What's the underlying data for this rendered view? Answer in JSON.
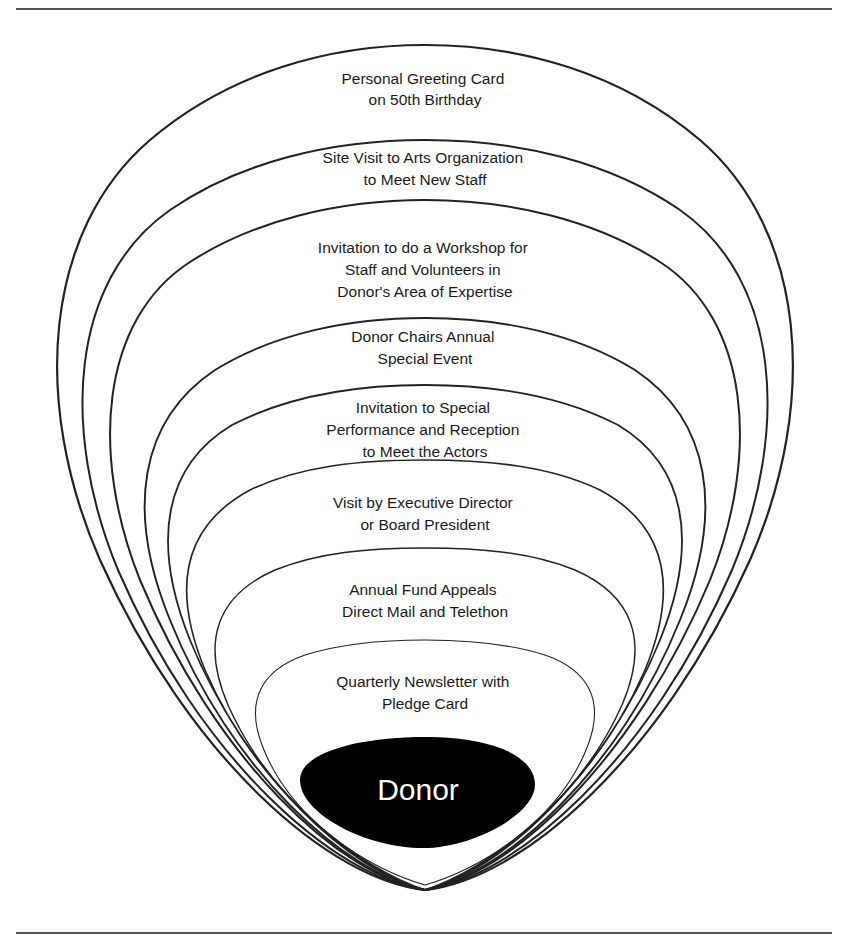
{
  "diagram": {
    "type": "nested-concentric-cultivation-diagram",
    "center": {
      "label": "Donor",
      "fill": "#000000",
      "text_color": "#ffffff"
    },
    "rings": [
      {
        "level": 1,
        "lines": [
          "Personal Greeting Card",
          "on 50th Birthday"
        ]
      },
      {
        "level": 2,
        "lines": [
          "Site Visit to Arts Organization",
          "to Meet New Staff"
        ]
      },
      {
        "level": 3,
        "lines": [
          "Invitation to do a Workshop for",
          "Staff and Volunteers in",
          "Donor's Area of Expertise"
        ]
      },
      {
        "level": 4,
        "lines": [
          "Donor Chairs Annual",
          "Special Event"
        ]
      },
      {
        "level": 5,
        "lines": [
          "Invitation to Special",
          "Performance and Reception",
          "to Meet the Actors"
        ]
      },
      {
        "level": 6,
        "lines": [
          "Visit by Executive Director",
          "or Board President"
        ]
      },
      {
        "level": 7,
        "lines": [
          "Annual Fund Appeals",
          "Direct Mail and Telethon"
        ]
      },
      {
        "level": 8,
        "lines": [
          "Quarterly Newsletter with",
          "Pledge Card"
        ]
      }
    ],
    "colors": {
      "stroke": "#222222",
      "background": "#ffffff",
      "rule": "#555555"
    }
  }
}
